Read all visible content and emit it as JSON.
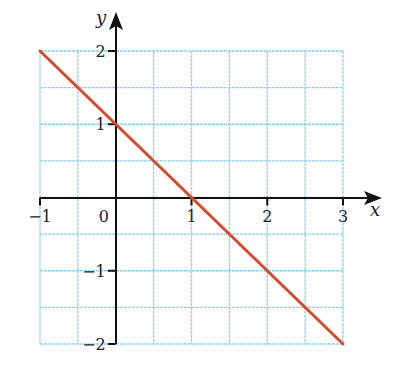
{
  "chart_data": {
    "type": "line",
    "title": "",
    "xlabel": "x",
    "ylabel": "y",
    "xlim": [
      -1,
      3
    ],
    "ylim": [
      -2,
      2
    ],
    "grid": true,
    "grid_step": 0.5,
    "x_ticks": [
      -1,
      0,
      1,
      2,
      3
    ],
    "y_ticks": [
      -2,
      -1,
      1,
      2
    ],
    "x_tick_labels": [
      "−1",
      "0",
      "1",
      "2",
      "3"
    ],
    "y_tick_labels": [
      "−2",
      "−1",
      "1",
      "2"
    ],
    "series": [
      {
        "name": "y = 1 - x",
        "x": [
          -1,
          0,
          1,
          2,
          3
        ],
        "y": [
          2,
          1,
          0,
          -1,
          -2
        ],
        "color": "#d9482b"
      }
    ]
  },
  "colors": {
    "grid": "#8fd0ee",
    "axis": "#111111",
    "line": "#d9482b"
  }
}
